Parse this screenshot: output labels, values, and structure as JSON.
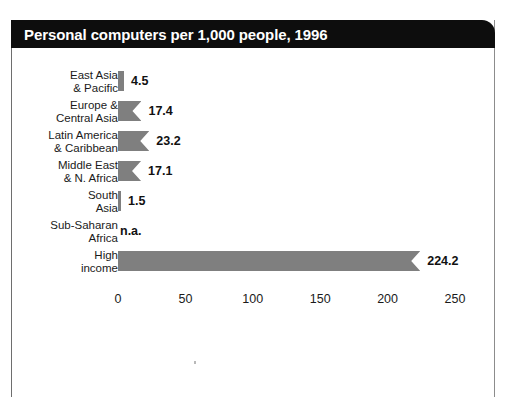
{
  "title": "Personal computers per 1,000 people, 1996",
  "colors": {
    "bar": "#7f7f7f",
    "title_bar": "#0d0d0d",
    "title_text": "#ffffff",
    "text": "#1a1a1a",
    "frame": "#6e6e6e",
    "background": "#ffffff"
  },
  "axis": {
    "ticks": [
      {
        "label": "0",
        "value": 0
      },
      {
        "label": "50",
        "value": 50
      },
      {
        "label": "100",
        "value": 100
      },
      {
        "label": "150",
        "value": 150
      },
      {
        "label": "200",
        "value": 200
      },
      {
        "label": "250",
        "value": 250
      }
    ]
  },
  "rows": [
    {
      "label": "East Asia\n& Pacific",
      "value_label": "4.5",
      "value": 4.5,
      "na": false
    },
    {
      "label": "Europe &\nCentral Asia",
      "value_label": "17.4",
      "value": 17.4,
      "na": false
    },
    {
      "label": "Latin America\n& Caribbean",
      "value_label": "23.2",
      "value": 23.2,
      "na": false
    },
    {
      "label": "Middle East\n& N. Africa",
      "value_label": "17.1",
      "value": 17.1,
      "na": false
    },
    {
      "label": "South\nAsia",
      "value_label": "1.5",
      "value": 1.5,
      "na": false
    },
    {
      "label": "Sub-Saharan\nAfrica",
      "value_label": "n.a.",
      "value": 0,
      "na": true
    },
    {
      "label": "High\nincome",
      "value_label": "224.2",
      "value": 224.2,
      "na": false
    }
  ],
  "chart_data": {
    "type": "bar",
    "orientation": "horizontal",
    "title": "Personal computers per 1,000 people, 1996",
    "xlabel": "",
    "ylabel": "",
    "xlim": [
      0,
      250
    ],
    "grid": false,
    "legend": null,
    "categories": [
      "East Asia & Pacific",
      "Europe & Central Asia",
      "Latin America & Caribbean",
      "Middle East & N. Africa",
      "South Asia",
      "Sub-Saharan Africa",
      "High income"
    ],
    "values": [
      4.5,
      17.4,
      23.2,
      17.1,
      1.5,
      null,
      224.2
    ],
    "value_labels": [
      "4.5",
      "17.4",
      "23.2",
      "17.1",
      "1.5",
      "n.a.",
      "224.2"
    ],
    "xticks": [
      0,
      50,
      100,
      150,
      200,
      250
    ],
    "xticklabels": [
      "0",
      "50",
      "100",
      "150",
      "200",
      "250"
    ],
    "annotations": [
      "n.a. = not available for Sub-Saharan Africa"
    ]
  }
}
